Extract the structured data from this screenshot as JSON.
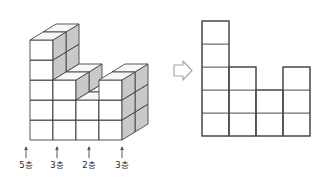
{
  "figure": {
    "title_visible": false,
    "transform_arrow": {
      "icon": "arrow-right-outline-icon",
      "label": "⇒"
    },
    "left_figure": {
      "name": "isometric-cube-stack",
      "description_visible": false,
      "columns": 4,
      "depth_rows": 2,
      "column_heights": [
        5,
        3,
        2,
        3
      ],
      "cube_face_color": "#ffffff",
      "cube_top_color": "#f7f7f7",
      "cube_side_color": "#c9c9c9",
      "cube_line_color": "#444444"
    },
    "right_figure": {
      "name": "front-view-grid",
      "columns": 4,
      "column_heights": [
        5,
        3,
        2,
        3
      ],
      "cell_fill": "#ffffff",
      "grid_line_color": "#6e6e6e",
      "outline_color": "#4a4a4a"
    },
    "axis_labels": [
      {
        "id": "col-1",
        "text": "5층",
        "tick": "↑"
      },
      {
        "id": "col-2",
        "text": "3층",
        "tick": "↑"
      },
      {
        "id": "col-3",
        "text": "2층",
        "tick": "↑"
      },
      {
        "id": "col-4",
        "text": "3층",
        "tick": "↑"
      }
    ]
  },
  "chart_data": {
    "type": "bar",
    "title": "",
    "subtitle": "",
    "xlabel": "",
    "ylabel": "",
    "categories": [
      "5층",
      "3층",
      "2층",
      "3층"
    ],
    "values": [
      5,
      3,
      2,
      3
    ],
    "ylim": [
      0,
      5
    ],
    "grid": true,
    "legend": false
  }
}
